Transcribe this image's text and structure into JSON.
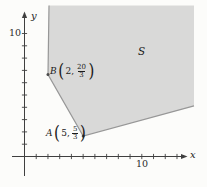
{
  "figure": {
    "region_label": "S",
    "axis_x_label": "x",
    "axis_y_label": "y",
    "x_tick_label": "10",
    "y_tick_label": "10"
  },
  "point_labels": {
    "A": {
      "name": "A",
      "x_part": "5,",
      "frac_num": "5",
      "frac_den": "3"
    },
    "B": {
      "name": "B",
      "x_part": "2,",
      "frac_num": "20",
      "frac_den": "3"
    }
  },
  "chart_data": {
    "type": "area",
    "title": "",
    "xlabel": "x",
    "ylabel": "y",
    "xlim": [
      0,
      13.7
    ],
    "ylim": [
      0,
      12.3
    ],
    "axes": {
      "x": {
        "tick_step": 1,
        "ticks_from": 1,
        "ticks_to": 13,
        "labeled_tick": 10
      },
      "y": {
        "tick_step": 1,
        "ticks_from": 1,
        "ticks_to": 10,
        "labeled_tick": 10
      }
    },
    "points": [
      {
        "label": "A",
        "x": 5,
        "y": 1.6667
      },
      {
        "label": "B",
        "x": 2,
        "y": 6.6667
      }
    ],
    "region": {
      "label": "S",
      "label_pos": {
        "x": 9.9,
        "y": 8.6
      },
      "vertices": [
        [
          2.09,
          12.28
        ],
        [
          14.45,
          12.28
        ],
        [
          14.45,
          4.11
        ],
        [
          5,
          1.6667
        ],
        [
          2,
          6.6667
        ]
      ],
      "stroked_boundary": [
        [
          2.09,
          12.28
        ],
        [
          2,
          6.6667
        ],
        [
          5,
          1.6667
        ],
        [
          14.45,
          4.11
        ]
      ]
    },
    "colors": {
      "region_fill": "#d9d9d8",
      "region_edge": "#979797",
      "axis": "#3f3f3f",
      "point_dot": "#4a4a4a",
      "text": "#1b1b1b"
    }
  }
}
